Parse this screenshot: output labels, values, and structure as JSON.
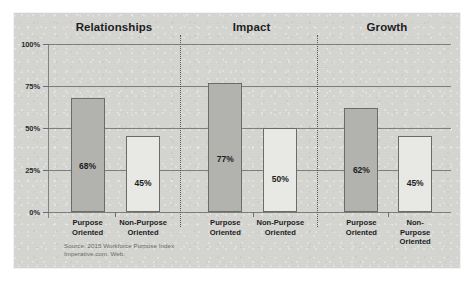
{
  "chart_data": {
    "type": "bar",
    "title": "",
    "xlabel": "",
    "ylabel": "",
    "ylim": [
      0,
      100
    ],
    "grid": true,
    "legend": "none",
    "y_ticks": [
      "0%",
      "25%",
      "50%",
      "75%",
      "100%"
    ],
    "y_tick_values": [
      0,
      25,
      50,
      75,
      100
    ],
    "categories": [
      "Purpose Oriented",
      "Non-Purpose Oriented"
    ],
    "panels": [
      {
        "title": "Relationships",
        "bars": [
          {
            "category_line1": "Purpose",
            "category_line2": "Oriented",
            "value": 68,
            "label": "68%",
            "style": "filled"
          },
          {
            "category_line1": "Non-Purpose",
            "category_line2": "Oriented",
            "value": 45,
            "label": "45%",
            "style": "hollow"
          }
        ]
      },
      {
        "title": "Impact",
        "bars": [
          {
            "category_line1": "Purpose",
            "category_line2": "Oriented",
            "value": 77,
            "label": "77%",
            "style": "filled"
          },
          {
            "category_line1": "Non-Purpose",
            "category_line2": "Oriented",
            "value": 50,
            "label": "50%",
            "style": "hollow"
          }
        ]
      },
      {
        "title": "Growth",
        "bars": [
          {
            "category_line1": "Purpose",
            "category_line2": "Oriented",
            "value": 62,
            "label": "62%",
            "style": "filled"
          },
          {
            "category_line1": "Non-Purpose",
            "category_line2": "Oriented",
            "value": 45,
            "label": "45%",
            "style": "hollow"
          }
        ]
      }
    ],
    "source_note": "Source: 2015 Workforce Purpose Index\nImperative.com. Web.",
    "colors": {
      "background": "#d5d5d2",
      "page": "#ffffff",
      "bar_filled": "#b2b2ae",
      "bar_hollow": "#e8e8e5",
      "bar_stroke": "#6b6b68",
      "gridline": "#6e6e6b",
      "text": "#1d1d1d",
      "source_text": "#6a6a66"
    }
  }
}
